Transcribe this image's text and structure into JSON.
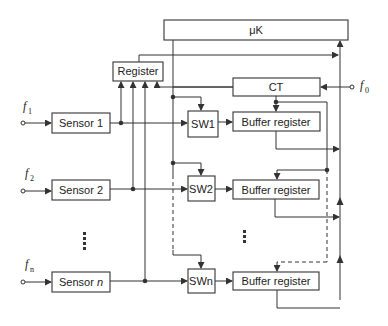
{
  "diagram": {
    "controller": {
      "label": "μK"
    },
    "register": {
      "label": "Register"
    },
    "counter": {
      "label": "CT"
    },
    "clock_input": {
      "symbol": "f",
      "subscript": "0"
    },
    "channels": [
      {
        "sensor": "Sensor 1",
        "sensor_base": "Sensor ",
        "sensor_idx": "1",
        "switch": "SW1",
        "buffer": "Buffer register",
        "input_symbol": "f",
        "input_subscript": "1"
      },
      {
        "sensor": "Sensor 2",
        "sensor_base": "Sensor ",
        "sensor_idx": "2",
        "switch": "SW2",
        "buffer": "Buffer register",
        "input_symbol": "f",
        "input_subscript": "2"
      },
      {
        "sensor": "Sensor n",
        "sensor_base": "Sensor ",
        "sensor_idx": "n",
        "switch": "SWn",
        "buffer": "Buffer register",
        "input_symbol": "f",
        "input_subscript": "n"
      }
    ],
    "ellipsis": "⋮"
  }
}
